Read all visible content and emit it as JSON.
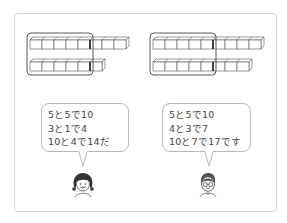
{
  "colors": {
    "stroke": "#555555",
    "cube_fill": "#ffffff",
    "frame_border": "#d6d6d6",
    "bubble_border": "#b8b8b8",
    "text": "#444444"
  },
  "diagrams": [
    {
      "name": "left-blocks",
      "rows": [
        {
          "total": 8,
          "grouped": 5,
          "extra": 3
        },
        {
          "total": 6,
          "grouped": 5,
          "extra": 1
        }
      ],
      "group_size": 5
    },
    {
      "name": "right-blocks",
      "rows": [
        {
          "total": 9,
          "grouped": 5,
          "extra": 4
        },
        {
          "total": 8,
          "grouped": 5,
          "extra": 3
        }
      ],
      "group_size": 5
    }
  ],
  "bubbles": [
    {
      "speaker": "girl",
      "lines": [
        "5と5で10",
        "3と1で4",
        "10と4で14だ"
      ]
    },
    {
      "speaker": "boy-with-glasses",
      "lines": [
        "5と5で10",
        "4と3で7",
        "10と7で17です"
      ]
    }
  ],
  "characters": [
    {
      "name": "girl",
      "icon": "girl-face-icon"
    },
    {
      "name": "boy",
      "icon": "boy-glasses-face-icon"
    }
  ]
}
